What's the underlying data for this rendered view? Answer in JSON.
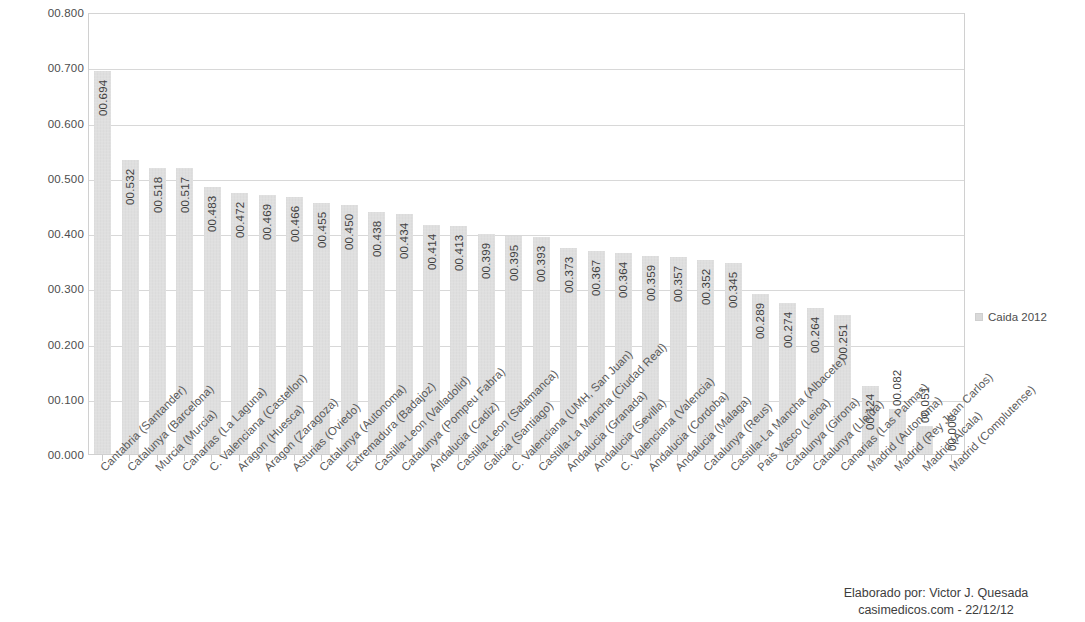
{
  "chart_data": {
    "type": "bar",
    "title": "",
    "subtitle": "",
    "xlabel": "",
    "ylabel": "",
    "ylim": [
      0,
      0.8
    ],
    "ytick_step": 0.1,
    "ytick_labels": [
      "00.800",
      "00.700",
      "00.600",
      "00.500",
      "00.400",
      "00.300",
      "00.200",
      "00.100",
      "00.000"
    ],
    "ytick_values": [
      0.8,
      0.7,
      0.6,
      0.5,
      0.4,
      0.3,
      0.2,
      0.1,
      0.0
    ],
    "grid": true,
    "grid_axis": "y",
    "legend": {
      "position": "right",
      "entries": [
        {
          "name": "Caida 2012",
          "color": "#d9d9d9"
        }
      ]
    },
    "series": [
      {
        "name": "Caida 2012",
        "color": "#d9d9d9",
        "value_label_format": "00.000",
        "values": [
          0.694,
          0.532,
          0.518,
          0.517,
          0.483,
          0.472,
          0.469,
          0.466,
          0.455,
          0.45,
          0.438,
          0.434,
          0.414,
          0.413,
          0.399,
          0.395,
          0.393,
          0.373,
          0.367,
          0.364,
          0.359,
          0.357,
          0.352,
          0.345,
          0.289,
          0.274,
          0.264,
          0.251,
          0.124,
          0.082,
          0.051,
          0.0
        ],
        "value_labels": [
          "00.694",
          "00.532",
          "00.518",
          "00.517",
          "00.483",
          "00.472",
          "00.469",
          "00.466",
          "00.455",
          "00.450",
          "00.438",
          "00.434",
          "00.414",
          "00.413",
          "00.399",
          "00.395",
          "00.393",
          "00.373",
          "00.367",
          "00.364",
          "00.359",
          "00.357",
          "00.352",
          "00.345",
          "00.289",
          "00.274",
          "00.264",
          "00.251",
          "00.124",
          "00.082",
          "00.051",
          "00.000"
        ]
      }
    ],
    "categories": [
      "Cantabria (Santander)",
      "Catalunya (Barcelona)",
      "Murcia (Murcia)",
      "Canarias (La Laguna)",
      "C. Valenciana (Castellon)",
      "Aragon (Huesca)",
      "Aragon (Zaragoza)",
      "Asturias (Oviedo)",
      "Catalunya (Autonoma)",
      "Extremadura (Badajoz)",
      "Castilla-Leon (Valladolid)",
      "Catalunya (Pompeu Fabra)",
      "Andalucia (Cadiz)",
      "Castilla-Leon (Salamanca)",
      "Galicia (Santiago)",
      "C. Valenciana (UMH, San Juan)",
      "Castilla-La Mancha (Ciudad Real)",
      "Andalucia (Granada)",
      "Andalucia (Sevilla)",
      "C. Valenciana (Valencia)",
      "Andalucia (Cordoba)",
      "Andalucia (Malaga)",
      "Catalunya (Reus)",
      "Castilla-La Mancha (Albacete)",
      "Pais Vasco (Leioa)",
      "Catalunya (Girona)",
      "Catalunya (Lleida)",
      "Canarias (Las Palmas)",
      "Madrid (Autonoma)",
      "Madrid (Rey Juan Carlos)",
      "Madrid (Alcala)",
      "Madrid (Complutense)"
    ]
  },
  "credit": {
    "line1": "Elaborado por: Victor J. Quesada",
    "line2": "casimedicos.com - 22/12/12"
  }
}
